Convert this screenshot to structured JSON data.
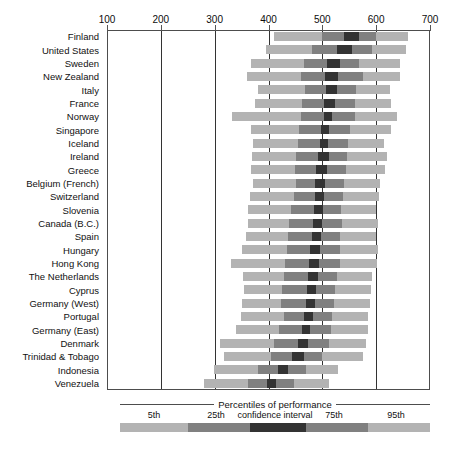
{
  "chart_data": {
    "type": "bar",
    "subtype": "percentile-range-bar",
    "title": "",
    "xlabel": "",
    "ylabel": "",
    "xlim": [
      100,
      700
    ],
    "xticks": [
      100,
      200,
      300,
      400,
      500,
      600,
      700
    ],
    "xtick_labels": [
      "100",
      "200",
      "300",
      "400",
      "500",
      "600",
      "700"
    ],
    "grid": "vertical",
    "legend_position": "bottom",
    "series_names": [
      "5th",
      "25th",
      "confidence interval",
      "75th",
      "95th"
    ],
    "colors": {
      "outer": "#b3b3b3",
      "mid": "#808080",
      "core": "#333333",
      "axis": "#333333",
      "frame": "#4d4d4d"
    },
    "categories": [
      "Finland",
      "United States",
      "Sweden",
      "New Zealand",
      "Italy",
      "France",
      "Norway",
      "Singapore",
      "Iceland",
      "Ireland",
      "Greece",
      "Belgium (French)",
      "Switzerland",
      "Slovenia",
      "Canada (B.C.)",
      "Spain",
      "Hungary",
      "Hong Kong",
      "The Netherlands",
      "Cyprus",
      "Germany (West)",
      "Portugal",
      "Germany (East)",
      "Denmark",
      "Trinidad & Tobago",
      "Indonesia",
      "Venezuela"
    ],
    "rows": [
      {
        "country": "Finland",
        "p5": 410,
        "p25": 500,
        "ci_low": 540,
        "ci_high": 568,
        "p75": 600,
        "p95": 660
      },
      {
        "country": "United States",
        "p5": 395,
        "p25": 481,
        "ci_low": 527,
        "ci_high": 556,
        "p75": 592,
        "p95": 655
      },
      {
        "country": "Sweden",
        "p5": 368,
        "p25": 466,
        "ci_low": 509,
        "ci_high": 532,
        "p75": 568,
        "p95": 645
      },
      {
        "country": "New Zealand",
        "p5": 360,
        "p25": 460,
        "ci_low": 505,
        "ci_high": 530,
        "p75": 576,
        "p95": 645
      },
      {
        "country": "Italy",
        "p5": 380,
        "p25": 468,
        "ci_low": 507,
        "ci_high": 527,
        "p75": 562,
        "p95": 625
      },
      {
        "country": "France",
        "p5": 375,
        "p25": 463,
        "ci_low": 504,
        "ci_high": 524,
        "p75": 560,
        "p95": 628
      },
      {
        "country": "Norway",
        "p5": 332,
        "p25": 460,
        "ci_low": 503,
        "ci_high": 518,
        "p75": 560,
        "p95": 638
      },
      {
        "country": "Singapore",
        "p5": 368,
        "p25": 456,
        "ci_low": 497,
        "ci_high": 512,
        "p75": 552,
        "p95": 628
      },
      {
        "country": "Iceland",
        "p5": 372,
        "p25": 455,
        "ci_low": 495,
        "ci_high": 510,
        "p75": 548,
        "p95": 614
      },
      {
        "country": "Ireland",
        "p5": 370,
        "p25": 452,
        "ci_low": 492,
        "ci_high": 512,
        "p75": 546,
        "p95": 620
      },
      {
        "country": "Greece",
        "p5": 368,
        "p25": 450,
        "ci_low": 489,
        "ci_high": 508,
        "p75": 544,
        "p95": 616
      },
      {
        "country": "Belgium (French)",
        "p5": 372,
        "p25": 452,
        "ci_low": 487,
        "ci_high": 505,
        "p75": 541,
        "p95": 608
      },
      {
        "country": "Switzerland",
        "p5": 366,
        "p25": 448,
        "ci_low": 486,
        "ci_high": 503,
        "p75": 538,
        "p95": 605
      },
      {
        "country": "Slovenia",
        "p5": 362,
        "p25": 442,
        "ci_low": 484,
        "ci_high": 502,
        "p75": 534,
        "p95": 600
      },
      {
        "country": "Canada (B.C.)",
        "p5": 362,
        "p25": 438,
        "ci_low": 482,
        "ci_high": 500,
        "p75": 536,
        "p95": 604
      },
      {
        "country": "Spain",
        "p5": 358,
        "p25": 436,
        "ci_low": 480,
        "ci_high": 497,
        "p75": 532,
        "p95": 600
      },
      {
        "country": "Hungary",
        "p5": 350,
        "p25": 434,
        "ci_low": 478,
        "ci_high": 496,
        "p75": 533,
        "p95": 604
      },
      {
        "country": "Hong Kong",
        "p5": 330,
        "p25": 430,
        "ci_low": 476,
        "ci_high": 494,
        "p75": 532,
        "p95": 601
      },
      {
        "country": "The Netherlands",
        "p5": 352,
        "p25": 428,
        "ci_low": 474,
        "ci_high": 492,
        "p75": 528,
        "p95": 592
      },
      {
        "country": "Cyprus",
        "p5": 354,
        "p25": 426,
        "ci_low": 472,
        "ci_high": 489,
        "p75": 524,
        "p95": 590
      },
      {
        "country": "Germany (West)",
        "p5": 350,
        "p25": 424,
        "ci_low": 470,
        "ci_high": 487,
        "p75": 522,
        "p95": 588
      },
      {
        "country": "Portugal",
        "p5": 348,
        "p25": 428,
        "ci_low": 466,
        "ci_high": 482,
        "p75": 518,
        "p95": 585
      },
      {
        "country": "Germany (East)",
        "p5": 340,
        "p25": 420,
        "ci_low": 462,
        "ci_high": 478,
        "p75": 516,
        "p95": 584
      },
      {
        "country": "Denmark",
        "p5": 310,
        "p25": 410,
        "ci_low": 455,
        "ci_high": 474,
        "p75": 512,
        "p95": 582
      },
      {
        "country": "Trinidad & Tobago",
        "p5": 318,
        "p25": 404,
        "ci_low": 444,
        "ci_high": 466,
        "p75": 500,
        "p95": 576
      },
      {
        "country": "Indonesia",
        "p5": 298,
        "p25": 380,
        "ci_low": 418,
        "ci_high": 436,
        "p75": 470,
        "p95": 530
      },
      {
        "country": "Venezuela",
        "p5": 280,
        "p25": 362,
        "ci_low": 398,
        "ci_high": 414,
        "p75": 448,
        "p95": 512
      }
    ]
  },
  "axis": {
    "ticks": [
      "100",
      "200",
      "300",
      "400",
      "500",
      "600",
      "700"
    ]
  },
  "legend": {
    "title": "Percentiles of performance",
    "ticks": [
      "5th",
      "25th",
      "confidence interval",
      "75th",
      "95th"
    ]
  },
  "caption": {
    "text": ""
  }
}
